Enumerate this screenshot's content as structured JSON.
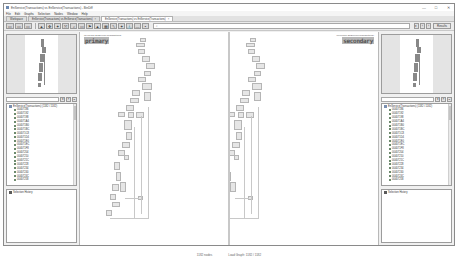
{
  "window": {
    "title": "EnService(Transactions) vs EnService(Transactions) - BinDiff",
    "controls": {
      "minimize": "—",
      "maximize": "□",
      "close": "✕"
    }
  },
  "menubar": [
    "File",
    "Edit",
    "Graphs",
    "Selection",
    "Nodes",
    "Window",
    "Help"
  ],
  "tabs": [
    {
      "label": "Workspace",
      "active": false
    },
    {
      "label": "EnService(Transactions) vs EnService(Transactions)",
      "active": false
    },
    {
      "label": "EnService(Transactions) vs EnService(Transactions)",
      "active": true
    }
  ],
  "toolbar": {
    "search_placeholder": "",
    "search_icon": "search-icon",
    "right_buttons": [
      "▾",
      "‹",
      "›"
    ],
    "mode_button": "Results"
  },
  "left_panel": {
    "tree_root": "EnService(Transactions) (1182 / 1182)",
    "tree_items": [
      "00407186",
      "00407192",
      "00407198",
      "004071A4",
      "004071B0",
      "004071BC",
      "004071C8",
      "004071D4",
      "004071E0",
      "004071EC",
      "004071F8",
      "00407204",
      "00407210",
      "0040721C",
      "00407228",
      "00407234",
      "00407240",
      "0040724C",
      "00407258",
      "00407264"
    ],
    "selection_history": "Selection History"
  },
  "right_panel": {
    "tree_root": "EnService(Transactions) (1182 / 1182)",
    "tree_items": [
      "00407186",
      "00407192",
      "00407198",
      "004071A4",
      "004071B0",
      "004071BC",
      "004071C8",
      "004071D4",
      "004071E0",
      "004071EC",
      "004071F8",
      "00407204",
      "00407210",
      "0040721C",
      "00407228",
      "00407234",
      "00407240",
      "0040724C",
      "00407258",
      "00407264"
    ],
    "selection_history": "Selection History"
  },
  "graphs": {
    "primary": {
      "header": "00407186 EnService(Transactions)",
      "label": "primary"
    },
    "secondary": {
      "header": "00407186 EnService(Transactions)",
      "label": "secondary"
    }
  },
  "statusbar": {
    "left": "1182 nodes",
    "right": "Load Graph: 1182 / 1182"
  }
}
